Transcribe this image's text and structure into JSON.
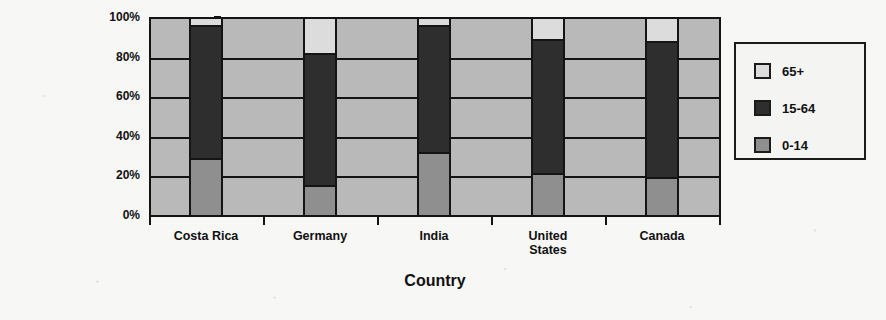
{
  "chart_data": {
    "type": "bar",
    "subtype": "stacked-percentage",
    "title": "",
    "xlabel": "Country",
    "ylabel": "Percentage",
    "categories": [
      "Costa Rica",
      "Germany",
      "India",
      "United States",
      "Canada"
    ],
    "category_label_lines": [
      [
        "Costa Rica"
      ],
      [
        "Germany"
      ],
      [
        "India"
      ],
      [
        "United",
        "States"
      ],
      [
        "Canada"
      ]
    ],
    "series": [
      {
        "name": "0-14",
        "color": "#8f8f8f",
        "values": [
          29,
          15,
          32,
          21,
          19
        ]
      },
      {
        "name": "15-64",
        "color": "#2e2e2e",
        "values": [
          67,
          67,
          64,
          68,
          69
        ]
      },
      {
        "name": "65+",
        "color": "#dcdcdc",
        "values": [
          4,
          18,
          4,
          11,
          12
        ]
      }
    ],
    "stack_tops": {
      "0-14": [
        29,
        15,
        32,
        21,
        19
      ],
      "15-64": [
        96,
        82,
        96,
        89,
        88
      ],
      "65+": [
        100,
        100,
        100,
        100,
        100
      ]
    },
    "ylim": [
      0,
      100
    ],
    "yticks": [
      0,
      20,
      40,
      60,
      80,
      100
    ],
    "ytick_labels": [
      "0%",
      "20%",
      "40%",
      "60%",
      "80%",
      "100%"
    ],
    "grid": true,
    "grid_axis": "y",
    "legend_position": "right-outside",
    "legend_order": [
      "65+",
      "15-64",
      "0-14"
    ],
    "plot_background": "#b9b9b9",
    "axis_color": "#141414"
  },
  "legend": {
    "items": [
      {
        "label": "65+",
        "color": "#dcdcdc"
      },
      {
        "label": "15-64",
        "color": "#2e2e2e"
      },
      {
        "label": "0-14",
        "color": "#8f8f8f"
      }
    ]
  },
  "axes": {
    "y_title": "Percentage",
    "x_title": "Country"
  }
}
